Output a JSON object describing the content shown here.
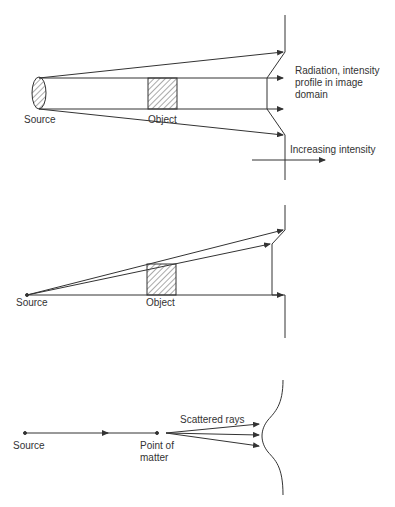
{
  "diagrams": [
    {
      "id": "parallel-beam",
      "labels": {
        "source": "Source",
        "object": "Object",
        "profile": "Radiation, intensity\nprofile in image\ndomain",
        "axis": "Increasing intensity"
      }
    },
    {
      "id": "point-source",
      "labels": {
        "source": "Source",
        "object": "Object"
      }
    },
    {
      "id": "scattering",
      "labels": {
        "source": "Source",
        "point": "Point of\nmatter",
        "scattered": "Scattered rays"
      }
    }
  ],
  "colors": {
    "line": "#333333",
    "hatch": "#555555",
    "background": "#ffffff"
  }
}
